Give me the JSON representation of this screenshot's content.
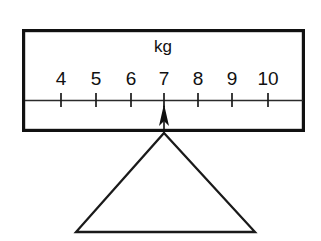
{
  "diagram": {
    "name": "weighing-scale-dial",
    "unit_label": "kg",
    "reading": "7",
    "scale": {
      "tick_labels": [
        "4",
        "5",
        "6",
        "7",
        "8",
        "9",
        "10"
      ],
      "tick_values": [
        4,
        5,
        6,
        7,
        8,
        9,
        10
      ],
      "tick_x": [
        61,
        96,
        131,
        164,
        198,
        232,
        268
      ],
      "min": 4,
      "max": 10,
      "step": 1,
      "axis_y": 100,
      "axis_x_start": 25,
      "axis_x_end": 303,
      "tick_top": 93,
      "tick_bottom": 107,
      "label_baseline": 85
    },
    "box": {
      "x": 22,
      "y": 29,
      "width": 283,
      "height": 103,
      "border_color": "#111111",
      "fill_color": "#ffffff",
      "border_width": 3.2
    },
    "unit_label_pos": {
      "x": 163,
      "y": 52
    },
    "pointer": {
      "name": "reading-pointer",
      "tip_x": 164,
      "tip_y": 104,
      "stem_bottom_y": 133,
      "head_half_width": 5,
      "head_height": 20,
      "color": "#111111"
    },
    "fulcrum": {
      "name": "fulcrum-triangle",
      "apex": {
        "x": 164,
        "y": 133
      },
      "left": {
        "x": 76,
        "y": 232
      },
      "right": {
        "x": 255,
        "y": 232
      },
      "stroke_color": "#1a1a1a",
      "fill": "none"
    },
    "background_color": "#ffffff"
  }
}
